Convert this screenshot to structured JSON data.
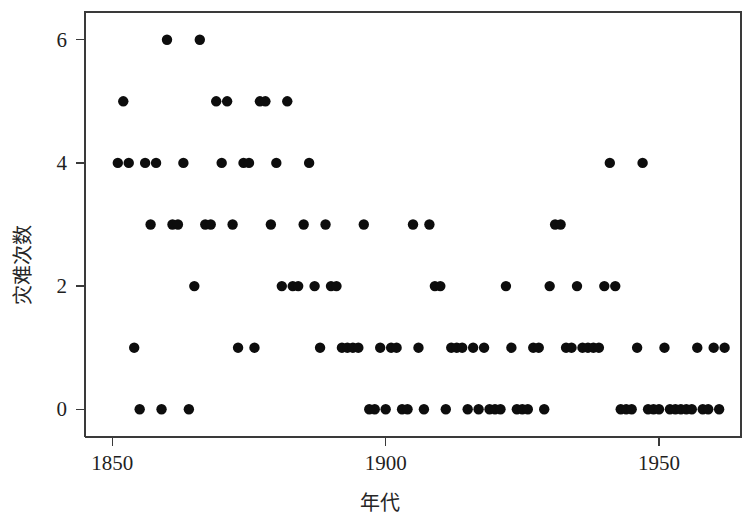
{
  "chart_data": {
    "type": "scatter",
    "title": "",
    "xlabel": "年代",
    "ylabel": "灾难次数",
    "xlim": [
      1845,
      1965
    ],
    "ylim": [
      -0.45,
      6.45
    ],
    "xticks": [
      1850,
      1900,
      1950
    ],
    "xtick_labels": [
      "1850",
      "1900",
      "1950"
    ],
    "yticks": [
      0,
      2,
      4,
      6
    ],
    "ytick_labels": [
      "0",
      "2",
      "4",
      "6"
    ],
    "grid": false,
    "legend": null,
    "marker": "filled-circle",
    "marker_color": "#0d0d0d",
    "marker_size": 5.2,
    "x": [
      1851,
      1852,
      1853,
      1854,
      1855,
      1856,
      1857,
      1858,
      1859,
      1860,
      1861,
      1862,
      1863,
      1864,
      1865,
      1866,
      1867,
      1868,
      1869,
      1870,
      1871,
      1872,
      1873,
      1874,
      1875,
      1876,
      1877,
      1878,
      1879,
      1880,
      1881,
      1882,
      1883,
      1884,
      1885,
      1886,
      1887,
      1888,
      1889,
      1890,
      1891,
      1892,
      1893,
      1894,
      1895,
      1896,
      1897,
      1898,
      1899,
      1900,
      1901,
      1902,
      1903,
      1904,
      1905,
      1906,
      1907,
      1908,
      1909,
      1910,
      1911,
      1912,
      1913,
      1914,
      1915,
      1916,
      1917,
      1918,
      1919,
      1920,
      1921,
      1922,
      1923,
      1924,
      1925,
      1926,
      1927,
      1928,
      1929,
      1930,
      1931,
      1932,
      1933,
      1934,
      1935,
      1936,
      1937,
      1938,
      1939,
      1940,
      1941,
      1942,
      1943,
      1944,
      1945,
      1946,
      1947,
      1948,
      1949,
      1950,
      1951,
      1952,
      1953,
      1954,
      1955,
      1956,
      1957,
      1958,
      1959,
      1960,
      1961,
      1962
    ],
    "y": [
      4,
      5,
      4,
      1,
      0,
      4,
      3,
      4,
      0,
      6,
      3,
      3,
      4,
      0,
      2,
      6,
      3,
      3,
      5,
      4,
      5,
      3,
      1,
      4,
      4,
      1,
      5,
      5,
      3,
      4,
      2,
      5,
      2,
      2,
      3,
      4,
      2,
      1,
      3,
      2,
      2,
      1,
      1,
      1,
      1,
      3,
      0,
      0,
      1,
      0,
      1,
      1,
      0,
      0,
      3,
      1,
      0,
      3,
      2,
      2,
      0,
      1,
      1,
      1,
      0,
      1,
      0,
      1,
      0,
      0,
      0,
      2,
      1,
      0,
      0,
      0,
      1,
      1,
      0,
      2,
      3,
      3,
      1,
      1,
      2,
      1,
      1,
      1,
      1,
      2,
      4,
      2,
      0,
      0,
      0,
      1,
      4,
      0,
      0,
      0,
      1,
      0,
      0,
      0,
      0,
      0,
      1,
      0,
      0,
      1,
      0,
      1
    ]
  },
  "axes": {
    "x_title": "年代",
    "y_title": "灾难次数"
  }
}
